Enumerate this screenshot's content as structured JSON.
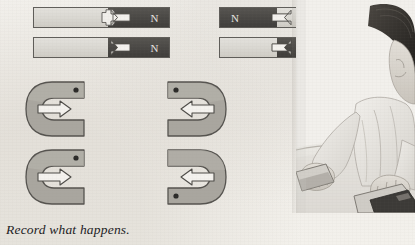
{
  "page": {
    "background_color": "#f2f0ec",
    "caption": "Record what happens."
  },
  "bar_magnets": [
    {
      "id": "bar-magnet-top-left",
      "left_half": "light",
      "right_half": "dark",
      "pole_label": "N",
      "pole_label_side": "right",
      "arrow_direction": "right",
      "x": 33,
      "y": 7,
      "width": 137,
      "height": 21,
      "split_percent": 55
    },
    {
      "id": "bar-magnet-bottom-left",
      "left_half": "light",
      "right_half": "dark",
      "pole_label": "N",
      "pole_label_side": "right",
      "arrow_direction": "right",
      "x": 33,
      "y": 37,
      "width": 137,
      "height": 21,
      "split_percent": 55
    },
    {
      "id": "bar-magnet-top-right",
      "left_half": "dark",
      "right_half": "light",
      "pole_label": "N",
      "pole_label_side": "left",
      "arrow_direction": "left",
      "x": 219,
      "y": 7,
      "width": 129,
      "height": 21,
      "split_percent": 45
    },
    {
      "id": "bar-magnet-bottom-right",
      "left_half": "light",
      "right_half": "dark",
      "pole_label": "N",
      "pole_label_side": "right",
      "arrow_direction": "left",
      "x": 219,
      "y": 37,
      "width": 129,
      "height": 21,
      "split_percent": 45
    }
  ],
  "horseshoe_magnets": [
    {
      "id": "horseshoe-top-left",
      "opening": "right",
      "dot_arm": "upper",
      "arrow_direction": "right",
      "x": 24,
      "y": 80,
      "width": 82,
      "height": 58
    },
    {
      "id": "horseshoe-top-right",
      "opening": "left",
      "dot_arm": "upper",
      "arrow_direction": "left",
      "x": 146,
      "y": 80,
      "width": 82,
      "height": 58
    },
    {
      "id": "horseshoe-bottom-left",
      "opening": "right",
      "dot_arm": "upper",
      "arrow_direction": "right",
      "x": 24,
      "y": 148,
      "width": 82,
      "height": 58
    },
    {
      "id": "horseshoe-bottom-right",
      "opening": "left",
      "dot_arm": "lower",
      "arrow_direction": "left",
      "x": 146,
      "y": 148,
      "width": 82,
      "height": 58
    }
  ],
  "photo": {
    "id": "photo-child-with-magnets",
    "description": "child at table handling bar magnets",
    "x": 296,
    "y": 0,
    "width": 119,
    "height": 213
  },
  "colors": {
    "magnet_light": "#d9d7d1",
    "magnet_dark": "#4a4845",
    "horseshoe_fill": "#a8a59e",
    "arrow_fill": "#f0eeea",
    "outline": "#5f5d59",
    "text": "#20201e"
  }
}
